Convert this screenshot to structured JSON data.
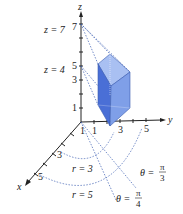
{
  "diagram": {
    "axes": {
      "z": {
        "label": "z",
        "ticks": [
          "1",
          "3",
          "5",
          "7"
        ]
      },
      "y": {
        "label": "y",
        "ticks": [
          "1",
          "3",
          "5"
        ]
      },
      "x": {
        "label": "x",
        "ticks": [
          "1",
          "3",
          "5"
        ]
      }
    },
    "plane_labels": {
      "z_top": "z = 7",
      "z_bottom": "z = 4"
    },
    "radius_labels": {
      "inner": "r = 3",
      "outer": "r = 5"
    },
    "angle_labels": {
      "theta1": {
        "prefix": "θ =",
        "num": "π",
        "den": "3"
      },
      "theta2": {
        "prefix": "θ =",
        "num": "π",
        "den": "4"
      }
    },
    "colors": {
      "solid_front": "#4a6fd6",
      "solid_side": "#7f9fe8",
      "solid_top": "#a9c0f2",
      "dotted": "#3a5cb0",
      "axis": "#222222"
    }
  }
}
